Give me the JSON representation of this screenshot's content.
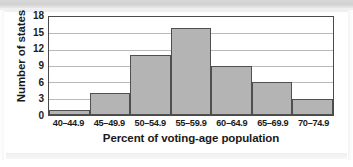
{
  "chart_data": {
    "type": "bar",
    "title": "",
    "subtitle": "",
    "xlabel": "Percent of voting-age population",
    "ylabel": "Number of states",
    "categories": [
      "40–44.9",
      "45–49.9",
      "50–54.9",
      "55–59.9",
      "60–64.9",
      "65–69.9",
      "70–74.9"
    ],
    "values": [
      1,
      4,
      11,
      16,
      9,
      6,
      3
    ],
    "ylim": [
      0,
      18
    ],
    "yticks": [
      0,
      3,
      6,
      9,
      12,
      15,
      18
    ],
    "ytick_labels": [
      "0",
      "3",
      "6",
      "9",
      "12",
      "15",
      "18"
    ],
    "grid": "horizontal",
    "legend": "none",
    "bar_fill_color": "#b4b4b4",
    "bar_border_color": "#4f4f4f",
    "axis_color": "#4a4a4a",
    "gridline_color": "#b9b9b9",
    "plot_background": "#ffffff"
  }
}
